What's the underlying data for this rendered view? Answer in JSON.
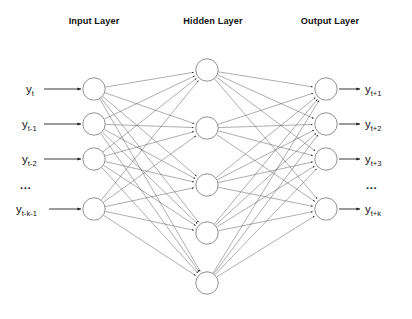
{
  "canvas": {
    "width": 412,
    "height": 319,
    "background": "#ffffff"
  },
  "titles": [
    {
      "text": "Input Layer",
      "x": 94,
      "y": 24
    },
    {
      "text": "Hidden Layer",
      "x": 213,
      "y": 24
    },
    {
      "text": "Output Layer",
      "x": 330,
      "y": 24
    }
  ],
  "layers": {
    "input": {
      "name": "Input Layer",
      "node_count": 4,
      "cx": 94,
      "radius": 11.2,
      "node_y": [
        89,
        124,
        159,
        209
      ]
    },
    "hidden": {
      "name": "Hidden Layer",
      "node_count": 5,
      "cx": 207,
      "radius": 11.2,
      "node_y": [
        70,
        128,
        185,
        233,
        283
      ]
    },
    "output": {
      "name": "Output Layer",
      "node_count": 4,
      "cx": 326,
      "radius": 11.2,
      "node_y": [
        89,
        124,
        159,
        209
      ]
    }
  },
  "input_labels": [
    {
      "base": "y",
      "sub": "t",
      "x": 26,
      "y": 93
    },
    {
      "base": "y",
      "sub": "t-1",
      "x": 22,
      "y": 128
    },
    {
      "base": "y",
      "sub": "t-2",
      "x": 22,
      "y": 163
    },
    {
      "base": "y",
      "sub": "t-k-1",
      "x": 16,
      "y": 213
    }
  ],
  "output_labels": [
    {
      "base": "y",
      "sub": "t+1",
      "x": 365,
      "y": 93
    },
    {
      "base": "y",
      "sub": "t+2",
      "x": 365,
      "y": 128
    },
    {
      "base": "y",
      "sub": "t+3",
      "x": 365,
      "y": 163
    },
    {
      "base": "y",
      "sub": "t+k",
      "x": 365,
      "y": 213
    }
  ],
  "ellipses": [
    {
      "text": "...",
      "x": 20,
      "y": 189,
      "side": "input"
    },
    {
      "text": "...",
      "x": 366,
      "y": 189,
      "side": "output"
    }
  ],
  "input_arrows": [
    {
      "x1": 44,
      "y1": 89,
      "x2": 81,
      "y2": 89
    },
    {
      "x1": 44,
      "y1": 124,
      "x2": 81,
      "y2": 124
    },
    {
      "x1": 44,
      "y1": 159,
      "x2": 81,
      "y2": 159
    },
    {
      "x1": 49,
      "y1": 209,
      "x2": 81,
      "y2": 209
    }
  ],
  "output_arrows": [
    {
      "x1": 339,
      "y1": 89,
      "x2": 360,
      "y2": 89
    },
    {
      "x1": 339,
      "y1": 124,
      "x2": 360,
      "y2": 124
    },
    {
      "x1": 339,
      "y1": 159,
      "x2": 360,
      "y2": 159
    },
    {
      "x1": 339,
      "y1": 209,
      "x2": 360,
      "y2": 209
    }
  ],
  "connections": {
    "input_to_hidden": "fully-connected",
    "hidden_to_output": "fully-connected",
    "edge_color": "#4a4a4a",
    "arrowheads": true
  },
  "colors": {
    "node_stroke": "#7c7c7c",
    "node_fill": "#ffffff",
    "edge": "#4a4a4a",
    "text": "#141414",
    "title": "#121212"
  }
}
